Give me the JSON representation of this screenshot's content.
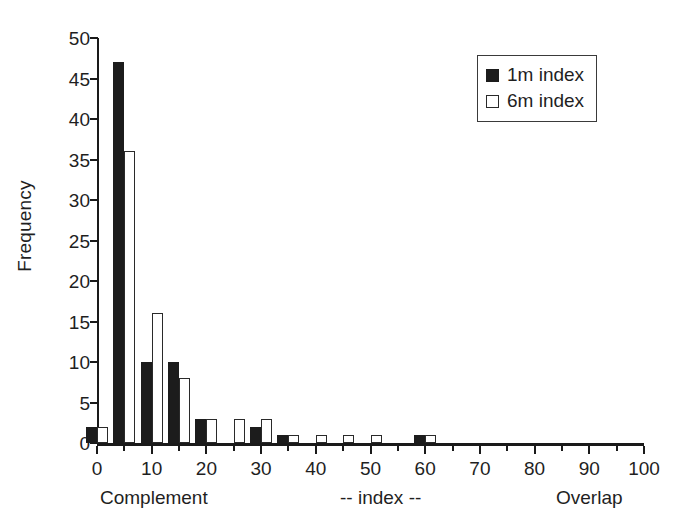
{
  "chart_data": {
    "type": "bar",
    "title": "",
    "subtitle": "",
    "xlabel": "",
    "ylabel": "Frequency",
    "xlim": [
      0,
      100
    ],
    "ylim": [
      0,
      50
    ],
    "grid": false,
    "legend_position": "top-right",
    "x_tick_labels": [
      "0",
      "10",
      "20",
      "30",
      "40",
      "50",
      "60",
      "70",
      "80",
      "90",
      "100"
    ],
    "x_tick_values": [
      0,
      10,
      20,
      30,
      40,
      50,
      60,
      70,
      80,
      90,
      100
    ],
    "x_minor_tick_values": [
      5,
      15,
      25,
      35,
      45,
      55,
      65,
      75,
      85,
      95
    ],
    "y_tick_labels": [
      "50",
      "45",
      "40",
      "35",
      "30",
      "25",
      "20",
      "15",
      "10",
      "5",
      "0"
    ],
    "y_tick_values": [
      50,
      45,
      40,
      35,
      30,
      25,
      20,
      15,
      10,
      5,
      0
    ],
    "categories": [
      0,
      5,
      10,
      15,
      20,
      25,
      30,
      35,
      40,
      45,
      50,
      55,
      60
    ],
    "series": [
      {
        "name": "1m index",
        "style": "filled",
        "color": "#1c1c1c",
        "values": [
          2,
          47,
          10,
          10,
          3,
          0,
          2,
          1,
          0,
          0,
          0,
          0,
          1
        ]
      },
      {
        "name": "6m index",
        "style": "open",
        "color": "#ffffff",
        "edge_color": "#2a2a2a",
        "values": [
          2,
          36,
          16,
          8,
          3,
          3,
          3,
          1,
          1,
          1,
          1,
          0,
          1
        ]
      }
    ],
    "annotations": {
      "x_left": "Complement",
      "x_middle": "-- index --",
      "x_right": "Overlap"
    }
  },
  "legend": {
    "items": [
      {
        "label": "1m index",
        "style": "filled"
      },
      {
        "label": "6m index",
        "style": "open"
      }
    ]
  }
}
